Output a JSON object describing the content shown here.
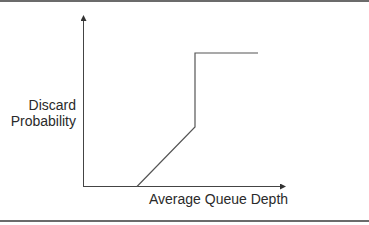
{
  "diagram": {
    "type": "piecewise-line-graph",
    "y_axis_label": [
      "Discard",
      "Probability"
    ],
    "x_axis_label": "Average Queue Depth",
    "curve_description": "Zero discard probability until a minimum threshold, then linear increase to a maximum threshold, then a vertical jump to full discard which stays constant",
    "colors": {
      "axis": "#333333",
      "curve": "#555555",
      "text": "#2a2a2a",
      "border": "#6b6b6b"
    }
  }
}
